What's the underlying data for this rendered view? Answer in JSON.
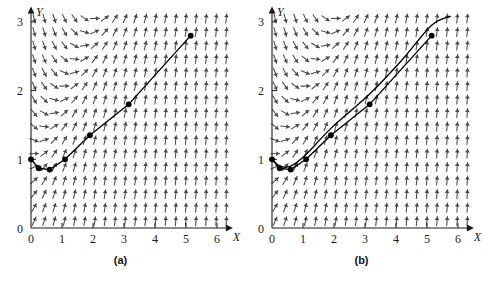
{
  "figure": {
    "background": "#ffffff",
    "ink": "#1a1a1a",
    "field_color": "#4a4a4a",
    "curve_color": "#000000",
    "panels": [
      {
        "id": "panel-a",
        "caption": "(a)",
        "axes": {
          "x_label": "X",
          "y_label": "Y",
          "x_ticks": [
            "0",
            "1",
            "2",
            "3",
            "4",
            "5",
            "6"
          ],
          "y_ticks": [
            "0",
            "1",
            "2",
            "3"
          ],
          "xlim": [
            0,
            6.35
          ],
          "ylim": [
            0,
            3.15
          ]
        }
      },
      {
        "id": "panel-b",
        "caption": "(b)",
        "axes": {
          "x_label": "X",
          "y_label": "Y",
          "x_ticks": [
            "0",
            "1",
            "2",
            "3",
            "4",
            "5",
            "6"
          ],
          "y_ticks": [
            "0",
            "1",
            "2",
            "3"
          ],
          "xlim": [
            0,
            6.35
          ],
          "ylim": [
            0,
            3.15
          ]
        }
      }
    ]
  },
  "chart_data": [
    {
      "type": "line",
      "title": "(a)",
      "xlabel": "X",
      "ylabel": "Y",
      "xlim": [
        0,
        6.35
      ],
      "ylim": [
        0,
        3.15
      ],
      "xticks": [
        0,
        1,
        2,
        3,
        4,
        5,
        6
      ],
      "yticks": [
        0,
        1,
        2,
        3
      ],
      "grid": false,
      "legend": "none",
      "background_field": {
        "type": "direction-field",
        "slope_formula": "dy/dx = x - y + 1",
        "x_range": [
          0.1,
          6.3
        ],
        "y_range": [
          0.1,
          3.05
        ],
        "nx": 20,
        "ny": 16,
        "arrow_color": "#4a4a4a"
      },
      "series": [
        {
          "name": "Euler polygonal approximation",
          "marker": "filled-circle",
          "x": [
            0,
            0.25,
            0.6,
            1.1,
            1.9,
            3.15,
            5.15
          ],
          "y": [
            1.0,
            0.87,
            0.85,
            1.0,
            1.35,
            1.8,
            2.8
          ]
        }
      ]
    },
    {
      "type": "line",
      "title": "(b)",
      "xlabel": "X",
      "ylabel": "Y",
      "xlim": [
        0,
        6.35
      ],
      "ylim": [
        0,
        3.15
      ],
      "xticks": [
        0,
        1,
        2,
        3,
        4,
        5,
        6
      ],
      "yticks": [
        0,
        1,
        2,
        3
      ],
      "grid": false,
      "legend": "none",
      "background_field": {
        "type": "direction-field",
        "slope_formula": "dy/dx = x - y + 1",
        "x_range": [
          0.1,
          6.3
        ],
        "y_range": [
          0.1,
          3.05
        ],
        "nx": 20,
        "ny": 16,
        "arrow_color": "#4a4a4a"
      },
      "series": [
        {
          "name": "Euler polygonal approximation",
          "marker": "filled-circle",
          "x": [
            0,
            0.25,
            0.6,
            1.1,
            1.9,
            3.15,
            5.15
          ],
          "y": [
            1.0,
            0.87,
            0.85,
            1.0,
            1.35,
            1.8,
            2.8
          ]
        },
        {
          "name": "Exact solution curve",
          "marker": "none",
          "x": [
            0,
            0.25,
            0.6,
            1.1,
            1.9,
            3.15,
            4.2,
            5.15,
            5.75
          ],
          "y": [
            1.0,
            0.9,
            0.9,
            1.07,
            1.45,
            1.95,
            2.45,
            2.95,
            3.08
          ]
        }
      ]
    }
  ]
}
